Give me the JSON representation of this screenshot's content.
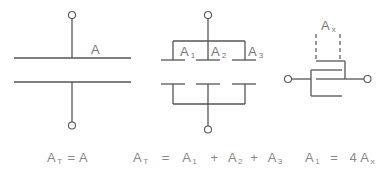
{
  "figures": [
    {
      "id": "single-plate-capacitor",
      "label": {
        "base": "A",
        "sub": ""
      },
      "equation": {
        "lhs_base": "A",
        "lhs_sub": "T",
        "rhs": "=  A"
      }
    },
    {
      "id": "three-parallel-plates",
      "labels": [
        {
          "base": "A",
          "sub": "1"
        },
        {
          "base": "A",
          "sub": "2"
        },
        {
          "base": "A",
          "sub": "3"
        }
      ],
      "equation": {
        "lhs_base": "A",
        "lhs_sub": "T",
        "terms": [
          {
            "base": "A",
            "sub": "1"
          },
          {
            "base": "A",
            "sub": "2"
          },
          {
            "base": "A",
            "sub": "3"
          }
        ],
        "equals": "=",
        "plus": "+"
      }
    },
    {
      "id": "interdigitated-plates",
      "label": {
        "base": "A",
        "sub": "x"
      },
      "equation": {
        "lhs_base": "A",
        "lhs_sub": "1",
        "equals": "=",
        "coef": "4",
        "rhs_base": "A",
        "rhs_sub": "x"
      }
    }
  ],
  "colors": {
    "line": "#555555",
    "label": "#777777",
    "equation": "#888888",
    "background": "#ffffff"
  }
}
